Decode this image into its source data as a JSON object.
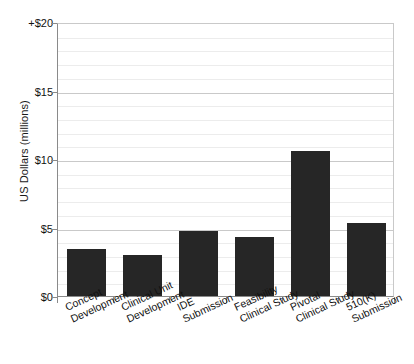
{
  "chart_data": {
    "type": "bar",
    "title": "",
    "xlabel": "",
    "ylabel": "US Dollars (millions)",
    "ylim": [
      0,
      20
    ],
    "grid": true,
    "legend": "none",
    "y_major_step": 5,
    "y_minor_step": 1,
    "categories": [
      "Concept Development",
      "Clinical Unit Development",
      "IDE Submission",
      "Feasibility Clinical Study",
      "Pivotal Clinical Study",
      "510(K) Submission"
    ],
    "category_lines": [
      [
        "Concept",
        "Development"
      ],
      [
        "Clinical Unit",
        "Development"
      ],
      [
        "IDE",
        "Submission"
      ],
      [
        "Feasibility",
        "Clinical Study"
      ],
      [
        "Pivotal",
        "Clinical Study"
      ],
      [
        "510(K)",
        "Submission"
      ]
    ],
    "values": [
      3.45,
      3.0,
      4.75,
      4.3,
      10.55,
      5.3
    ],
    "ytick_labels": [
      "+$20",
      "$15",
      "$10",
      "$5",
      "$0"
    ],
    "ytick_values": [
      20,
      15,
      10,
      5,
      0
    ],
    "bar_color": "#262626",
    "axis_color": "#8a8a8a",
    "grid_color": "#ececec",
    "grid_major_color": "#c9c9c9",
    "background": "#ffffff"
  }
}
